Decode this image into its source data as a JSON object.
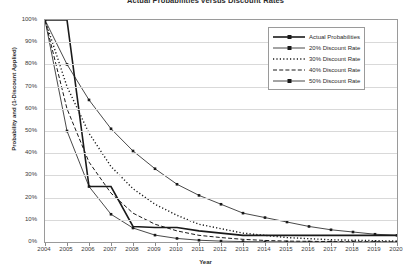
{
  "chart_data": {
    "type": "line",
    "title": "Actual Probabilities versus Discount Rates",
    "xlabel": "Year",
    "ylabel": "Probability and (1-Discount Applied)",
    "xlim": [
      2004,
      2020
    ],
    "ylim": [
      0,
      100
    ],
    "grid": true,
    "legend_position": "top-right",
    "x": [
      2004,
      2005,
      2006,
      2007,
      2008,
      2009,
      2010,
      2011,
      2012,
      2013,
      2014,
      2015,
      2016,
      2017,
      2018,
      2019,
      2020
    ],
    "x_tick_labels": [
      "2004",
      "2005",
      "2006",
      "2007",
      "2008",
      "2009",
      "2010",
      "2011",
      "2012",
      "2013",
      "2014",
      "2015",
      "2016",
      "2017",
      "2018",
      "2019",
      "2020"
    ],
    "y_tick_labels": [
      "0%",
      "10%",
      "20%",
      "30%",
      "40%",
      "50%",
      "60%",
      "70%",
      "80%",
      "90%",
      "100%"
    ],
    "y_ticks": [
      0,
      10,
      20,
      30,
      40,
      50,
      60,
      70,
      80,
      90,
      100
    ],
    "series": [
      {
        "name": "Actual Probabilities",
        "style": "solid-thick-marker",
        "values": [
          100,
          100,
          25,
          25,
          7,
          6.5,
          6.5,
          5,
          4,
          3,
          3,
          3,
          3,
          3,
          3,
          3,
          3
        ]
      },
      {
        "name": "20% Discount Rate",
        "style": "solid-marker",
        "values": [
          100,
          80,
          64,
          51,
          41,
          33,
          26,
          21,
          17,
          13,
          11,
          9,
          7,
          5.5,
          4.5,
          3.5,
          3
        ]
      },
      {
        "name": "30% Discount Rate",
        "style": "dotted",
        "values": [
          100,
          70,
          49,
          34,
          24,
          17,
          12,
          8,
          6,
          4,
          3,
          2,
          1.5,
          1,
          0.8,
          0.6,
          0.4
        ]
      },
      {
        "name": "40% Discount Rate",
        "style": "dashed",
        "values": [
          100,
          60,
          36,
          22,
          13,
          8,
          5,
          3,
          2,
          1.2,
          0.7,
          0.4,
          0.3,
          0.2,
          0.1,
          0.1,
          0.05
        ]
      },
      {
        "name": "50% Discount Rate",
        "style": "solid-marker",
        "values": [
          100,
          50,
          25,
          12.5,
          6.3,
          3.1,
          1.6,
          0.8,
          0.4,
          0.2,
          0.1,
          0.05,
          0.02,
          0.01,
          0.01,
          0.005,
          0.002
        ]
      }
    ],
    "legend": [
      {
        "label": "Actual Probabilities",
        "style": "solid-thick-marker"
      },
      {
        "label": "20% Discount Rate",
        "style": "solid-marker"
      },
      {
        "label": "30% Discount Rate",
        "style": "dotted"
      },
      {
        "label": "40% Discount Rate",
        "style": "dashed"
      },
      {
        "label": "50% Discount Rate",
        "style": "solid-marker"
      }
    ],
    "colors": {
      "line": "#1a1a1a",
      "grid": "#d9d9d9",
      "axis": "#9a9a9a",
      "text": "#2b2b2b",
      "background": "#ffffff"
    }
  }
}
